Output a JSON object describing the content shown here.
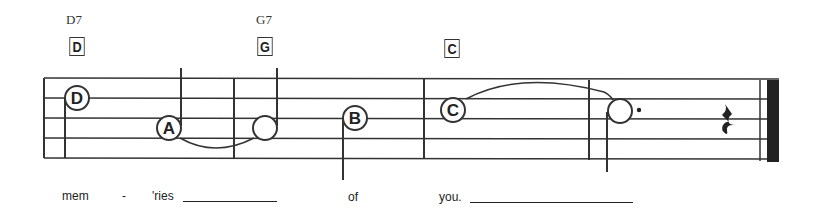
{
  "chords": [
    {
      "name": "D7",
      "box": "D",
      "x": 66
    },
    {
      "name": "G7",
      "box": "G",
      "x": 256
    },
    {
      "name": "",
      "box": "C",
      "x": 443
    }
  ],
  "notes": [
    {
      "letter": "D",
      "type": "quarter",
      "x": 77,
      "y": 98,
      "stem": "down-left"
    },
    {
      "letter": "A",
      "type": "quarter",
      "x": 169,
      "y": 128,
      "stem": "up-right"
    },
    {
      "letter": "",
      "type": "half",
      "x": 265,
      "y": 128,
      "stem": "up-right"
    },
    {
      "letter": "B",
      "type": "quarter",
      "x": 355,
      "y": 118,
      "stem": "down-left"
    },
    {
      "letter": "C",
      "type": "quarter",
      "x": 453,
      "y": 108,
      "stem": "none"
    },
    {
      "letter": "",
      "type": "dotted-half",
      "x": 620,
      "y": 111,
      "stem": "down-left"
    }
  ],
  "rest": {
    "type": "quarter-rest",
    "x": 723
  },
  "lyrics": [
    {
      "text": "mem",
      "x": 62
    },
    {
      "text": "-",
      "x": 122
    },
    {
      "text": "'ries",
      "x": 152
    },
    {
      "text": "of",
      "x": 348
    },
    {
      "text": "you.",
      "x": 439
    }
  ],
  "extender_lines": [
    {
      "x1": 183,
      "x2": 277
    },
    {
      "x1": 470,
      "x2": 633
    }
  ],
  "colors": {
    "ink": "#222222",
    "background": "#ffffff"
  }
}
